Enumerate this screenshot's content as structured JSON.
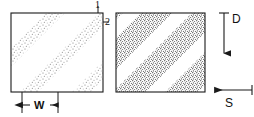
{
  "figure": {
    "type": "technical-diagram",
    "background": "#ffffff",
    "line_color": "#1a1a1a",
    "stipple_color": "#6b6b6b"
  },
  "panels": [
    {
      "id": "left-block",
      "name": "block-1",
      "x": 11,
      "y": 13,
      "width": 92,
      "height": 79,
      "stipple_density": "light",
      "band_angle_deg": 45,
      "band_count": 3
    },
    {
      "id": "right-block",
      "name": "block-2",
      "x": 116,
      "y": 13,
      "width": 89,
      "height": 79,
      "stipple_density": "dark",
      "band_angle_deg": 45,
      "band_count": 3
    }
  ],
  "callouts": [
    {
      "id": "callout-1",
      "label": "1",
      "x": 95,
      "y": 1,
      "leader": true
    },
    {
      "id": "callout-2",
      "label": "2",
      "x": 104,
      "y": 17,
      "leader": true
    }
  ],
  "dimensions": [
    {
      "id": "width-dimension",
      "label": "W",
      "label_x": 34,
      "label_y": 101,
      "line_y": 105,
      "tick_left_x": 22,
      "tick_right_x": 58,
      "tick_top_y": 92,
      "tick_bottom_y": 113,
      "arrow_style": "outward"
    }
  ],
  "arrows": [
    {
      "id": "arrow-d",
      "label": "D",
      "direction": "down",
      "label_x": 232,
      "label_y": 15,
      "x": 224,
      "y_start": 13,
      "y_end": 58,
      "cap": "top-bar"
    },
    {
      "id": "arrow-s",
      "label": "S",
      "direction": "left",
      "label_x": 225,
      "label_y": 99,
      "y": 90,
      "x_start": 252,
      "x_end": 210,
      "cap": "right-bar"
    }
  ]
}
